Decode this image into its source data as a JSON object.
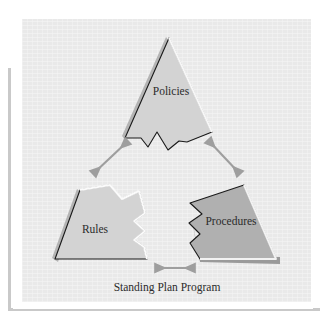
{
  "figure": {
    "name": "standing-plan-program-puzzle-triangle",
    "caption": "Standing Plan Program",
    "background_color": "#e9e9e9",
    "page_color": "#ffffff",
    "rule_color": "#c9c9c9"
  },
  "pieces": [
    {
      "id": "policies",
      "label": "Policies",
      "position": "top",
      "fill": "#d3d3d3",
      "outline": "#1a1a1a",
      "highlight": "#f7f7f7",
      "shadow": "#b4b4b4"
    },
    {
      "id": "rules",
      "label": "Rules",
      "position": "bottom-left",
      "fill": "#d3d3d3",
      "outline": "#1a1a1a",
      "highlight": "#fbfbfb",
      "shadow": "#b4b4b4"
    },
    {
      "id": "procedures",
      "label": "Procedures",
      "position": "bottom-right",
      "fill": "#b0b0b0",
      "outline": "#1a1a1a",
      "highlight": "#f2f2f2",
      "shadow": "#9a9a9a"
    }
  ],
  "connectors": [
    {
      "id": "policies-rules",
      "from": "rules",
      "to": "policies",
      "style": "double-headed-arrow",
      "orientation": "diagonal-up-right",
      "color": "#9e9e9e"
    },
    {
      "id": "policies-procedures",
      "from": "policies",
      "to": "procedures",
      "style": "double-headed-arrow",
      "orientation": "diagonal-down-right",
      "color": "#9e9e9e"
    },
    {
      "id": "rules-procedures",
      "from": "rules",
      "to": "procedures",
      "style": "double-headed-arrow",
      "orientation": "horizontal",
      "color": "#9e9e9e"
    }
  ]
}
